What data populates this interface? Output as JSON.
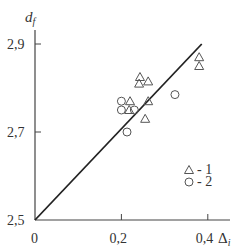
{
  "chart_data": {
    "type": "scatter",
    "title": "",
    "xlabel": "Δ",
    "xlabel_sub": "i",
    "ylabel": "d",
    "ylabel_sub": "f",
    "xlim": [
      0,
      0.45
    ],
    "ylim": [
      2.5,
      2.93
    ],
    "x_ticks": [
      {
        "value": 0,
        "label": "0"
      },
      {
        "value": 0.2,
        "label": "0,2"
      },
      {
        "value": 0.4,
        "label": "0,4"
      }
    ],
    "y_ticks": [
      {
        "value": 2.5,
        "label": "2,5"
      },
      {
        "value": 2.7,
        "label": "2,7"
      },
      {
        "value": 2.9,
        "label": "2,9"
      }
    ],
    "grid": false,
    "legend_position": "lower right",
    "series": [
      {
        "name": "1",
        "marker": "triangle",
        "points": [
          {
            "x": 0.38,
            "y": 2.87
          },
          {
            "x": 0.38,
            "y": 2.85
          },
          {
            "x": 0.243,
            "y": 2.825
          },
          {
            "x": 0.241,
            "y": 2.81
          },
          {
            "x": 0.262,
            "y": 2.815
          },
          {
            "x": 0.22,
            "y": 2.77
          },
          {
            "x": 0.218,
            "y": 2.75
          },
          {
            "x": 0.262,
            "y": 2.77
          },
          {
            "x": 0.255,
            "y": 2.73
          }
        ]
      },
      {
        "name": "2",
        "marker": "circle",
        "points": [
          {
            "x": 0.2,
            "y": 2.77
          },
          {
            "x": 0.2,
            "y": 2.75
          },
          {
            "x": 0.23,
            "y": 2.75
          },
          {
            "x": 0.213,
            "y": 2.7
          },
          {
            "x": 0.324,
            "y": 2.785
          }
        ]
      }
    ],
    "reference_line": {
      "x0": 0,
      "y0": 2.5,
      "x1": 0.386,
      "y1": 2.9
    }
  },
  "legend": [
    {
      "marker": "triangle",
      "label": "- 1"
    },
    {
      "marker": "circle",
      "label": "- 2"
    }
  ],
  "colors": {
    "ink": "#333333",
    "marker": "#555555",
    "background": "#ffffff"
  }
}
